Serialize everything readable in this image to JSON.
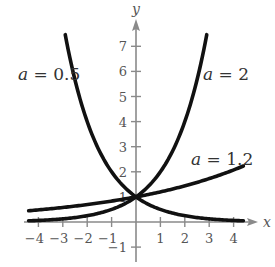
{
  "chart_data": {
    "type": "line",
    "title": "",
    "xlabel": "x",
    "ylabel": "y",
    "xlim": [
      -4.4,
      4.6
    ],
    "ylim": [
      -1.4,
      7.6
    ],
    "grid": false,
    "legend": "inline labels",
    "x_ticks": [
      -4,
      -3,
      -2,
      -1,
      1,
      2,
      3,
      4
    ],
    "y_ticks": [
      -1,
      1,
      2,
      3,
      4,
      5,
      6,
      7
    ],
    "x_tick_labels": [
      "−4",
      "−3",
      "−2",
      "−1",
      "1",
      "2",
      "3",
      "4"
    ],
    "y_tick_labels": [
      "−1",
      "1",
      "2",
      "3",
      "4",
      "5",
      "6",
      "7"
    ],
    "series": [
      {
        "name": "a = 0.5",
        "function": "y = 0.5^x",
        "x": [
          -2.9,
          -2.5,
          -2,
          -1.5,
          -1,
          -0.5,
          0,
          0.5,
          1,
          1.5,
          2,
          2.5,
          3,
          3.5,
          4,
          4.4
        ],
        "values": [
          7.46,
          5.66,
          4,
          2.83,
          2,
          1.41,
          1,
          0.71,
          0.5,
          0.35,
          0.25,
          0.18,
          0.13,
          0.09,
          0.06,
          0.05
        ]
      },
      {
        "name": "a = 2",
        "function": "y = 2^x",
        "x": [
          -4.4,
          -4,
          -3.5,
          -3,
          -2.5,
          -2,
          -1.5,
          -1,
          -0.5,
          0,
          0.5,
          1,
          1.5,
          2,
          2.5,
          2.9
        ],
        "values": [
          0.05,
          0.06,
          0.09,
          0.13,
          0.18,
          0.25,
          0.35,
          0.5,
          0.71,
          1,
          1.41,
          2,
          2.83,
          4,
          5.66,
          7.46
        ]
      },
      {
        "name": "a = 1.2",
        "function": "y = 1.2^x",
        "x": [
          -4.4,
          -4,
          -3,
          -2,
          -1,
          0,
          1,
          2,
          3,
          4,
          4.4
        ],
        "values": [
          0.45,
          0.48,
          0.58,
          0.69,
          0.83,
          1,
          1.2,
          1.44,
          1.73,
          2.07,
          2.23
        ]
      }
    ],
    "annotations": [
      {
        "text": "a = 0.5",
        "x": -3.9,
        "y": 5.8
      },
      {
        "text": "a = 2",
        "x": 2.7,
        "y": 5.8
      },
      {
        "text": "a = 1.2",
        "x": 2.4,
        "y": 2.9
      }
    ]
  },
  "labels": {
    "x_axis": "x",
    "y_axis": "y",
    "curve_a05_var": "a",
    "curve_a05_rest": " = 0.5",
    "curve_a2_var": "a",
    "curve_a2_rest": " = 2",
    "curve_a12_var": "a",
    "curve_a12_rest": " = 1.2"
  }
}
